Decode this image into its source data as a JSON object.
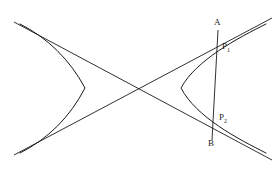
{
  "figure": {
    "kind": "hyperbola-with-chord-diagram",
    "background_color": "#ffffff",
    "stroke_color": "#1a1a1a",
    "label_color": "#1a1a1a",
    "width": 280,
    "height": 177,
    "center": {
      "x": 137,
      "y": 88
    },
    "labels": [
      {
        "id": "A",
        "text": "A",
        "sub": "",
        "x": 218,
        "y": 30
      },
      {
        "id": "B",
        "text": "B",
        "sub": "",
        "x": 212,
        "y": 140
      },
      {
        "id": "P1",
        "text": "P",
        "sub": "1",
        "x": 217,
        "y": 43
      },
      {
        "id": "P2",
        "text": "P",
        "sub": "2",
        "x": 213,
        "y": 122
      }
    ],
    "asymptotes": [
      {
        "id": "asymptote-rising",
        "x1": 14,
        "y1": 155,
        "x2": 272,
        "y2": 18
      },
      {
        "id": "asymptote-falling",
        "x1": 14,
        "y1": 22,
        "x2": 272,
        "y2": 160
      }
    ],
    "branches": [
      {
        "id": "left-branch",
        "vertex_x": 85,
        "vertex_y": 88,
        "opens": "left"
      },
      {
        "id": "right-branch",
        "vertex_x": 181,
        "vertex_y": 88,
        "opens": "right"
      }
    ],
    "chord": {
      "id": "chord-AB",
      "x1": 218,
      "y1": 30,
      "x2": 212,
      "y2": 140
    }
  }
}
